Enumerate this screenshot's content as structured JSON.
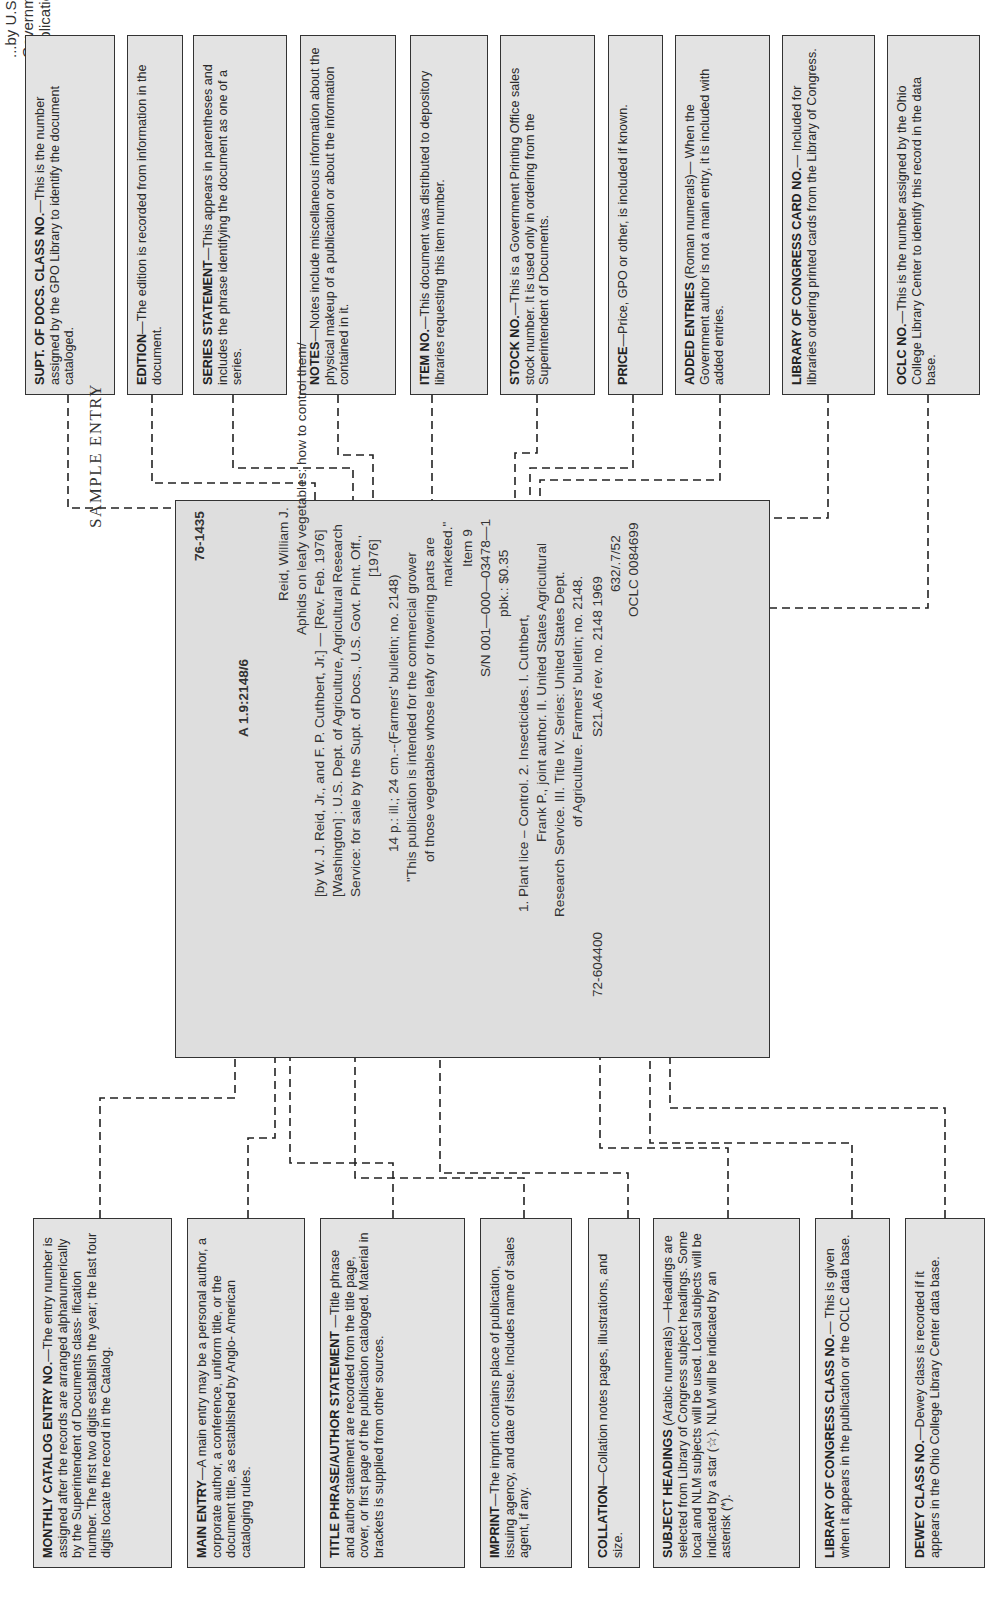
{
  "header": {
    "cutoff_title": "...by U.S. Government Publications."
  },
  "sample_label": "SAMPLE ENTRY",
  "top_boxes": [
    {
      "term": "SUPT. OF DOCS. CLASS NO.",
      "text": "—This is the number assigned by the GPO Library to identify the document cataloged."
    },
    {
      "term": "EDITION",
      "text": "—The edition is recorded from information in the document."
    },
    {
      "term": "SERIES STATEMENT",
      "text": "—This appears in parentheses and includes the phrase identifying the document as one of a series."
    },
    {
      "term": "NOTES",
      "text": "—Notes include miscellaneous information about the physical makeup of a publication or about the information contained in it."
    },
    {
      "term": "ITEM NO.",
      "text": "—This document was distributed to depository libraries requesting this item number."
    },
    {
      "term": "STOCK NO.",
      "text": "—This is a Government Printing Office sales stock number.  It is used only in ordering from the Superintendent of Documents."
    },
    {
      "term": "PRICE",
      "text": "—Price, GPO or other, is included if known."
    },
    {
      "term": "ADDED ENTRIES",
      "text": " (Roman numerals)— When the Government author is not a main entry, it is included with added entries."
    },
    {
      "term": "LIBRARY OF CONGRESS CARD NO.",
      "text": "— Included for libraries ordering printed cards from the Library of Congress."
    },
    {
      "term": "OCLC NO.",
      "text": "—This is the number assigned by the Ohio College Library Center to identify this record in the data base."
    }
  ],
  "bottom_boxes": [
    {
      "term": "MONTHLY CATALOG ENTRY NO.",
      "text": "—The entry number is assigned after the records are arranged alphanumerically by the Superintendent of Documents class- ification number.  The first two digits establish the year; the last four digits locate the record in the Catalog."
    },
    {
      "term": "MAIN ENTRY",
      "text": "—A main entry may be a personal author, a corporate author, a conference, uniform title, or the document title, as established by Anglo- American cataloging rules."
    },
    {
      "term": "TITLE PHRASE/AUTHOR STATEMENT",
      "text": " —Title phrase and author statement are recorded from the title page, cover, or first page of the publication cataloged. Material in brackets is supplied from other sources."
    },
    {
      "term": "IMPRINT",
      "text": "—The imprint contains place of publication, issuing agency, and date of issue.  Includes name of sales agent, if any."
    },
    {
      "term": "COLLATION",
      "text": "—Collation notes pages, illustrations, and size."
    },
    {
      "term": "SUBJECT HEADINGS",
      "text": " (Arabic numerals) —Headings are selected from Library of Congress subject headings.  Some local and NLM subjects will be used.  Local subjects will be indicated by a star (☆).  NLM will be indicated by an asterisk (*)."
    },
    {
      "term": "LIBRARY OF CONGRESS CLASS NO.",
      "text": "— This is given when it appears in the publication or the OCLC data base."
    },
    {
      "term": "DEWEY CLASS NO.",
      "text": "—Dewey class is recorded if it appears in the Ohio College Library Center data base."
    }
  ],
  "entry": {
    "entry_no": "76-1435",
    "class_no": "A 1.9:2148/6",
    "lines": [
      "Reid, William J.",
      "Aphids on leafy vegetables: how to control them/",
      "[by W. J. Reid, Jr., and F. P. Cuthbert, Jr.] — [Rev. Feb. 1976]",
      "[Washington] : U.S. Dept. of Agriculture, Agricultural Research",
      "Service:  for sale by the Supt. of Docs., U.S. Govt. Print. Off.,",
      "[1976]",
      "14 p.: ill.; 24 cm.--(Farmers' bulletin; no. 2148)",
      "\"This publication is intended for the commercial grower",
      "of those vegetables whose leafy or flowering parts are",
      "marketed.\"",
      "Item 9",
      "S/N 001—000—03478—1",
      "pbk.:  $0.35",
      "1.  Plant lice – Control.   2.  Insecticides.   I.  Cuthbert,",
      "Frank P., joint author.   II.  United States Agricultural",
      "Research Service.   III.  Title   IV.  Series:  United States Dept.",
      "of Agriculture.  Farmers' bulletin; no. 2148.",
      "S21.A6 rev. no. 2148 1969",
      "632/.7/52",
      "OCLC  0084699"
    ],
    "lc_card_no": "72-604400"
  }
}
